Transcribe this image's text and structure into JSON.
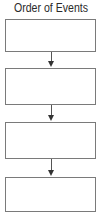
{
  "diagram": {
    "title": "Order of Events",
    "type": "vertical-flowchart",
    "colors": {
      "box_border": "#7a7a7a",
      "arrow": "#333333",
      "text": "#2a2a2a",
      "background": "#ffffff"
    },
    "boxes": [
      {
        "label": ""
      },
      {
        "label": ""
      },
      {
        "label": ""
      },
      {
        "label": ""
      }
    ],
    "arrows": [
      {
        "from": 0,
        "to": 1
      },
      {
        "from": 1,
        "to": 2
      },
      {
        "from": 2,
        "to": 3
      }
    ]
  }
}
